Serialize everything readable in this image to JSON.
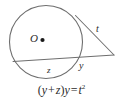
{
  "figure": {
    "type": "geometry-diagram",
    "stroke_color": "#6e6e6e",
    "text_color": "#2b2b2b",
    "background_color": "#ffffff"
  },
  "labels": {
    "center": "O",
    "tangent": "t",
    "external_secant": "y",
    "chord": "z"
  },
  "equation": {
    "open_paren": "(",
    "term1": "y",
    "plus": "+",
    "term2": "z",
    "close_paren": ")",
    "term3": "y",
    "equals": "=",
    "term4": "t",
    "exponent": "2",
    "full": "(y + z)y = t²"
  },
  "geometry": {
    "circle": {
      "cx": 46,
      "cy": 42,
      "r": 37
    },
    "center_dot": {
      "cx": 42,
      "cy": 40,
      "r": 2
    },
    "external_point": {
      "x": 114,
      "y": 55
    },
    "tangent_point": {
      "x": 75,
      "y": 16
    },
    "secant_near_point": {
      "x": 78,
      "y": 48
    },
    "secant_far_point": {
      "x": 13,
      "y": 61
    }
  }
}
